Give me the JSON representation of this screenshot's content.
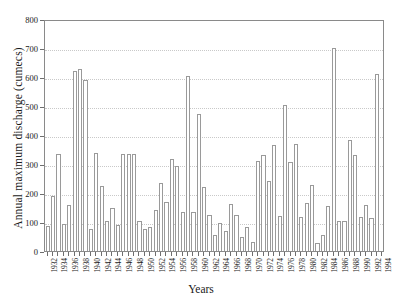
{
  "chart_data": {
    "type": "bar",
    "title": "",
    "xlabel": "Years",
    "ylabel": "Annual maximum discharge (cumecs)",
    "ylim": [
      0,
      800
    ],
    "yticks": [
      0,
      100,
      200,
      300,
      400,
      500,
      600,
      700,
      800
    ],
    "grid": true,
    "legend": false,
    "xtick_step": 2,
    "categories": [
      "1932",
      "1933",
      "1934",
      "1935",
      "1936",
      "1937",
      "1938",
      "1939",
      "1940",
      "1941",
      "1942",
      "1943",
      "1944",
      "1945",
      "1946",
      "1947",
      "1948",
      "1949",
      "1950",
      "1951",
      "1952",
      "1953",
      "1954",
      "1955",
      "1956",
      "1957",
      "1958",
      "1959",
      "1960",
      "1961",
      "1962",
      "1963",
      "1964",
      "1965",
      "1966",
      "1967",
      "1968",
      "1969",
      "1970",
      "1971",
      "1972",
      "1973",
      "1974",
      "1975",
      "1976",
      "1977",
      "1978",
      "1979",
      "1980",
      "1981",
      "1982",
      "1983",
      "1984",
      "1985",
      "1986",
      "1987",
      "1988",
      "1989",
      "1990",
      "1991",
      "1992",
      "1993",
      "1994"
    ],
    "values": [
      85,
      188,
      335,
      92,
      158,
      622,
      627,
      588,
      75,
      338,
      224,
      105,
      150,
      90,
      333,
      333,
      335,
      103,
      77,
      82,
      140,
      234,
      170,
      318,
      294,
      133,
      604,
      136,
      473,
      222,
      125,
      55,
      98,
      70,
      163,
      125,
      48,
      84,
      30,
      310,
      330,
      240,
      365,
      122,
      503,
      308,
      368,
      117,
      165,
      228,
      28,
      55,
      155,
      700,
      105,
      105,
      383,
      330,
      117,
      158,
      113,
      612,
      0
    ]
  },
  "axis": {
    "x_min_year": 1932,
    "x_max_year": 1994
  }
}
